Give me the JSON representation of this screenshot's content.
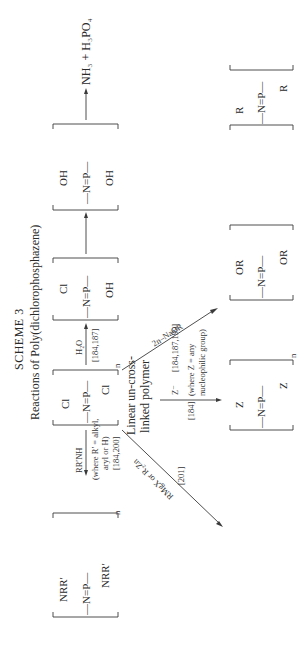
{
  "scheme": {
    "title": "SCHEME 3",
    "subtitle": "Reactions of Poly(dichlorophosphazene)"
  },
  "central": {
    "backbone": "—N=P—",
    "sub_top": "Cl",
    "sub_bottom": "Cl",
    "repeat": "n",
    "note_line1": "Linear un-cross-",
    "note_line2": "linked polymer"
  },
  "hydrolysis": {
    "reagent": "H₂O",
    "refs": "[184,187]",
    "intermediate1": {
      "backbone": "—N=P—",
      "sub_top": "Cl",
      "sub_bottom": "OH"
    },
    "intermediate2": {
      "backbone": "—N=P—",
      "sub_top": "OH",
      "sub_bottom": "OH"
    },
    "products": "NH₃ + H₃PO₄"
  },
  "amine_route": {
    "reagent": "RR′NH",
    "condition1": "(where R′ = alkyl,",
    "condition2": "aryl or H)",
    "refs": "[184,200]",
    "product": {
      "backbone": "—N=P—",
      "sub_top": "NRR′",
      "sub_bottom": "NRR′",
      "repeat": "n"
    }
  },
  "organometallic_route": {
    "reagent": "RMgX or R₂Zn",
    "refs": "[201]",
    "product": {
      "backbone": "—N=P—",
      "sub_top": "R",
      "sub_bottom": "R"
    }
  },
  "nucleophile_route": {
    "reagent": "Z⁻",
    "refs": "[184]",
    "condition1": "(where Z = any",
    "condition2": "nucleophilic group)",
    "product": {
      "backbone": "—N=P—",
      "sub_top": "Z",
      "sub_bottom": "Z",
      "repeat": "n"
    }
  },
  "alkoxide_route": {
    "reagent": "2n–NaOR",
    "refs": "[184,187,199]",
    "product": {
      "backbone": "—N=P—",
      "sub_top": "OR",
      "sub_bottom": "OR"
    }
  }
}
